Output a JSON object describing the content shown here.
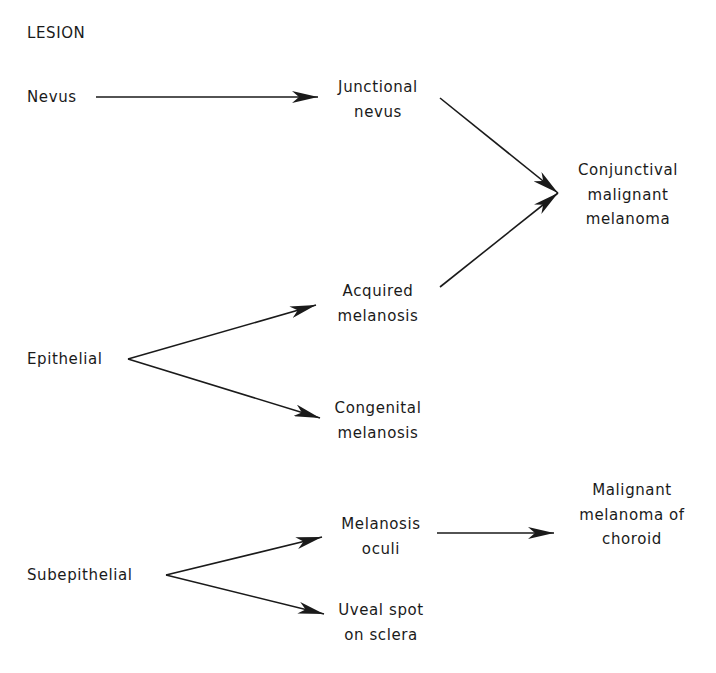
{
  "title": "LESION",
  "sources": [
    {
      "id": "nevus",
      "label": "Nevus"
    },
    {
      "id": "epithelial",
      "label": "Epithelial"
    },
    {
      "id": "subepithelial",
      "label": "Subepithelial"
    }
  ],
  "nodes": {
    "junctional_nevus": [
      "Junctional",
      "nevus"
    ],
    "acquired_melanosis": [
      "Acquired",
      "melanosis"
    ],
    "congenital_melanosis": [
      "Congenital",
      "melanosis"
    ],
    "melanosis_oculi": [
      "Melanosis",
      "oculi"
    ],
    "uveal_spot": [
      "Uveal spot",
      "on sclera"
    ],
    "conjunctival_melanoma": [
      "Conjunctival",
      "malignant",
      "melanoma"
    ],
    "choroid_melanoma": [
      "Malignant",
      "melanoma of",
      "choroid"
    ]
  },
  "edges": [
    {
      "from": "Nevus",
      "to": "Junctional nevus"
    },
    {
      "from": "Epithelial",
      "to": "Acquired melanosis"
    },
    {
      "from": "Epithelial",
      "to": "Congenital melanosis"
    },
    {
      "from": "Subepithelial",
      "to": "Melanosis oculi"
    },
    {
      "from": "Subepithelial",
      "to": "Uveal spot on sclera"
    },
    {
      "from": "Junctional nevus",
      "to": "Conjunctival malignant melanoma"
    },
    {
      "from": "Acquired melanosis",
      "to": "Conjunctival malignant melanoma"
    },
    {
      "from": "Melanosis oculi",
      "to": "Malignant melanoma of choroid"
    }
  ],
  "colors": {
    "ink": "#1a1a1a",
    "background": "#ffffff"
  }
}
